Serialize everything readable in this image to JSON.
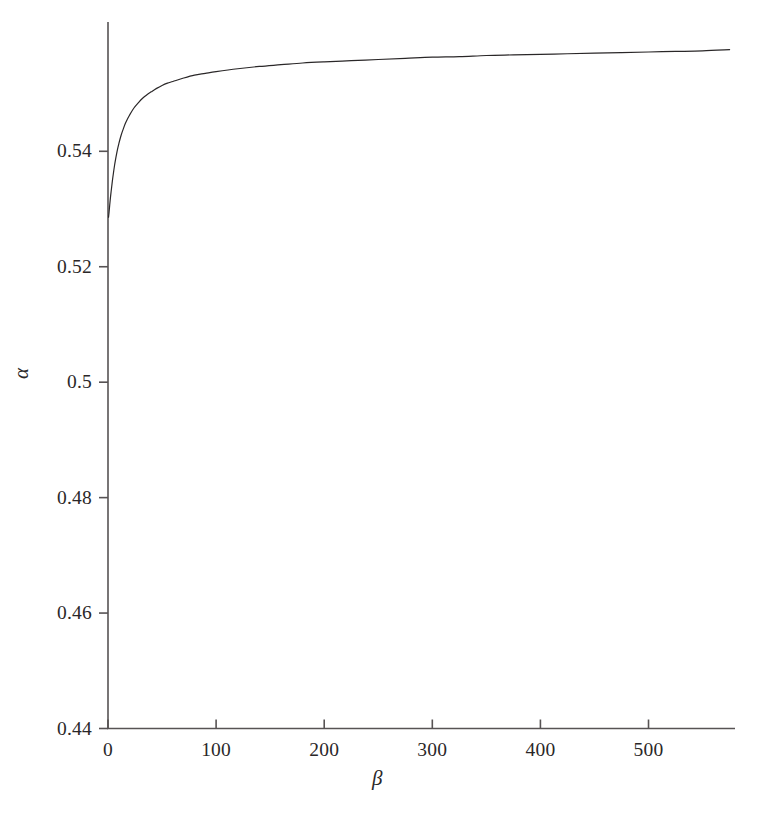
{
  "chart_data": {
    "type": "line",
    "title": "",
    "subtitle": "",
    "xlabel": "β",
    "ylabel": "α",
    "xlim": [
      0,
      580
    ],
    "ylim": [
      0.44,
      0.5624
    ],
    "xticks": [
      0,
      100,
      200,
      300,
      400,
      500
    ],
    "xticklabels": [
      "0",
      "100",
      "200",
      "300",
      "400",
      "500"
    ],
    "yticks": [
      0.44,
      0.46,
      0.48,
      0.5,
      0.52,
      0.54
    ],
    "yticklabels": [
      "0.44",
      "0.46",
      "0.48",
      "0.5",
      "0.52",
      "0.54"
    ],
    "grid": false,
    "legend": null,
    "line_color": "#2a2728",
    "line_width": 1.2,
    "series": [
      {
        "name": "alpha(beta)",
        "x": [
          0.5,
          1,
          2,
          3,
          4,
          5,
          6,
          7,
          8,
          9,
          10,
          12,
          14,
          16,
          18,
          20,
          24,
          28,
          32,
          36,
          40,
          45,
          50,
          55,
          60,
          70,
          80,
          90,
          100,
          120,
          140,
          160,
          180,
          200,
          225,
          250,
          275,
          300,
          325,
          350,
          375,
          400,
          425,
          450,
          475,
          500,
          525,
          550,
          575
        ],
        "y": [
          0.5286,
          0.5295,
          0.5315,
          0.5332,
          0.5348,
          0.5362,
          0.5375,
          0.5386,
          0.5396,
          0.5405,
          0.5413,
          0.5427,
          0.5438,
          0.5448,
          0.5456,
          0.5463,
          0.5475,
          0.5484,
          0.5492,
          0.5498,
          0.5503,
          0.5509,
          0.5514,
          0.5518,
          0.5521,
          0.5527,
          0.5532,
          0.5535,
          0.5538,
          0.5543,
          0.5547,
          0.555,
          0.5553,
          0.5555,
          0.5557,
          0.5559,
          0.5561,
          0.5563,
          0.5564,
          0.5566,
          0.5567,
          0.5568,
          0.5569,
          0.557,
          0.5571,
          0.5572,
          0.5573,
          0.5574,
          0.5576
        ]
      }
    ]
  },
  "axes": {
    "x_axis_name": "beta-axis",
    "y_axis_name": "alpha-axis"
  }
}
